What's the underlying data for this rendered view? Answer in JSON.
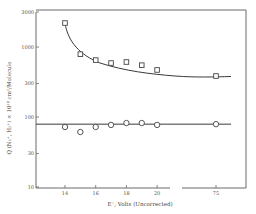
{
  "chart_data": {
    "type": "scatter",
    "title": "",
    "xlabel": "E⁺, Volts (Uncorrected)",
    "ylabel": "Q (N₂⁺, H₂⁺) × 10¹⁸ cm²/Molecule",
    "yscale": "log",
    "ylim": [
      10,
      3000
    ],
    "yticks": [
      {
        "value": 3000,
        "label": "3000"
      },
      {
        "value": 1000,
        "label": "1000"
      },
      {
        "value": 300,
        "label": "300"
      },
      {
        "value": 100,
        "label": "100"
      },
      {
        "value": 30,
        "label": "30"
      },
      {
        "value": 10,
        "label": "10"
      }
    ],
    "xticks": [
      {
        "value": 14,
        "label": "14"
      },
      {
        "value": 16,
        "label": "16"
      },
      {
        "value": 18,
        "label": "18"
      },
      {
        "value": 20,
        "label": "20"
      },
      {
        "value": 75,
        "label": "75"
      }
    ],
    "x_axis_break": {
      "between": [
        20,
        75
      ]
    },
    "grid": false,
    "legend": null,
    "x": [
      14,
      15,
      16,
      17,
      18,
      19,
      20,
      75
    ],
    "series": [
      {
        "name": "squares",
        "marker": "square",
        "values": [
          2200,
          790,
          650,
          590,
          610,
          550,
          470,
          385
        ],
        "fit": "decaying curve"
      },
      {
        "name": "circles",
        "marker": "circle",
        "values": [
          72,
          61,
          72,
          77,
          82,
          82,
          77,
          79
        ],
        "fit": "horizontal line",
        "fit_value": 79
      }
    ]
  }
}
